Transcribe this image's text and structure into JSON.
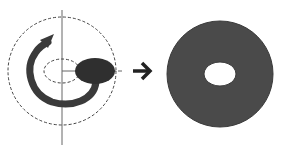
{
  "diagram": {
    "title": "Revolution of an ellipse around an axis producing a torus",
    "colors": {
      "background": "#ffffff",
      "line": "#555555",
      "dashed": "#444444",
      "dark_fill": "#3a3a3a",
      "torus_fill": "#4a4a4a",
      "arrow": "#222222",
      "hole": "#ffffff"
    },
    "elements": {
      "axis_cross": "Vertical and horizontal axis lines",
      "outer_path": "Dashed circular path of revolution",
      "inner_path": "Dashed inner ellipse path",
      "profile": "Filled ellipse cross-section",
      "rotation_arrow": "Curved rotation arrow",
      "result_arrow": "Right arrow",
      "result_shape": "Resulting torus (ring) with elliptical hole"
    }
  }
}
